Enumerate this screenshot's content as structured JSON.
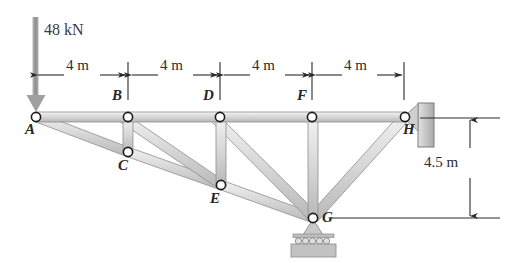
{
  "figure": {
    "canvas": {
      "width": 513,
      "height": 263
    },
    "colors": {
      "member_fill": "#d2d2d2",
      "member_stroke": "#8a8a8a",
      "member_highlight": "#efefef",
      "node_stroke": "#1a1a1a",
      "node_fill": "#ffffff",
      "dimension_line": "#2b2b2b",
      "text": "#2b2b2b",
      "wall_fill": "#c9c9c9",
      "wall_stroke": "#7d7d7d",
      "load_arrow": "#9a9a9a",
      "support_fill": "#c4c4c4"
    }
  },
  "load": {
    "label": "48 kN",
    "applied_at": "A",
    "direction": "down"
  },
  "nodes": [
    {
      "id": "A",
      "label": "A",
      "x": 36,
      "y": 117,
      "label_x": 26,
      "label_y": 124
    },
    {
      "id": "B",
      "label": "B",
      "x": 128,
      "y": 117,
      "label_x": 113,
      "label_y": 92
    },
    {
      "id": "C",
      "label": "C",
      "x": 128,
      "y": 152,
      "label_x": 118,
      "label_y": 159
    },
    {
      "id": "D",
      "label": "D",
      "x": 220,
      "y": 117,
      "label_x": 203,
      "label_y": 92
    },
    {
      "id": "E",
      "label": "E",
      "x": 221,
      "y": 185,
      "label_x": 210,
      "label_y": 192
    },
    {
      "id": "F",
      "label": "F",
      "x": 312,
      "y": 117,
      "label_x": 297,
      "label_y": 92
    },
    {
      "id": "G",
      "label": "G",
      "x": 313,
      "y": 218,
      "label_x": 322,
      "label_y": 216
    },
    {
      "id": "H",
      "label": "H",
      "x": 405,
      "y": 117,
      "label_x": 403,
      "label_y": 126
    }
  ],
  "members": [
    {
      "from": "A",
      "to": "B",
      "name": "member-AB"
    },
    {
      "from": "B",
      "to": "D",
      "name": "member-BD"
    },
    {
      "from": "D",
      "to": "F",
      "name": "member-DF"
    },
    {
      "from": "F",
      "to": "H",
      "name": "member-FH"
    },
    {
      "from": "A",
      "to": "C",
      "name": "member-AC"
    },
    {
      "from": "C",
      "to": "E",
      "name": "member-CE"
    },
    {
      "from": "E",
      "to": "G",
      "name": "member-EG"
    },
    {
      "from": "G",
      "to": "H",
      "name": "member-GH"
    },
    {
      "from": "B",
      "to": "C",
      "name": "member-BC"
    },
    {
      "from": "D",
      "to": "E",
      "name": "member-DE"
    },
    {
      "from": "F",
      "to": "G",
      "name": "member-FG"
    },
    {
      "from": "B",
      "to": "E",
      "name": "member-BE"
    },
    {
      "from": "D",
      "to": "G",
      "name": "member-DG"
    }
  ],
  "dimensions": {
    "horizontal": {
      "line_y": 75,
      "segments": [
        {
          "label": "4 m",
          "x1": 36,
          "x2": 128,
          "text_x": 82,
          "text_y": 66
        },
        {
          "label": "4 m",
          "x1": 133,
          "x2": 220,
          "text_x": 177,
          "text_y": 66
        },
        {
          "label": "4 m",
          "x1": 225,
          "x2": 312,
          "text_x": 269,
          "text_y": 66
        },
        {
          "label": "4 m",
          "x1": 317,
          "x2": 404,
          "text_x": 361,
          "text_y": 66
        }
      ],
      "ticks_x": [
        128,
        220,
        312,
        404
      ],
      "tick_y1": 62,
      "tick_y2": 100
    },
    "vertical": {
      "label": "4.5 m",
      "line_x": 470,
      "y_top": 118,
      "y_bottom": 218,
      "text_x": 432,
      "text_y": 161,
      "lead_top": {
        "x1": 420,
        "x2": 500,
        "y": 118
      },
      "lead_bottom": {
        "x1": 330,
        "x2": 500,
        "y": 218
      }
    }
  },
  "supports": [
    {
      "type": "pin-wall",
      "at": "H",
      "name": "pin-support-wall-H"
    },
    {
      "type": "roller",
      "at": "G",
      "name": "roller-support-G"
    }
  ],
  "wall": {
    "x": 418,
    "y": 103,
    "width": 16,
    "height": 44
  }
}
